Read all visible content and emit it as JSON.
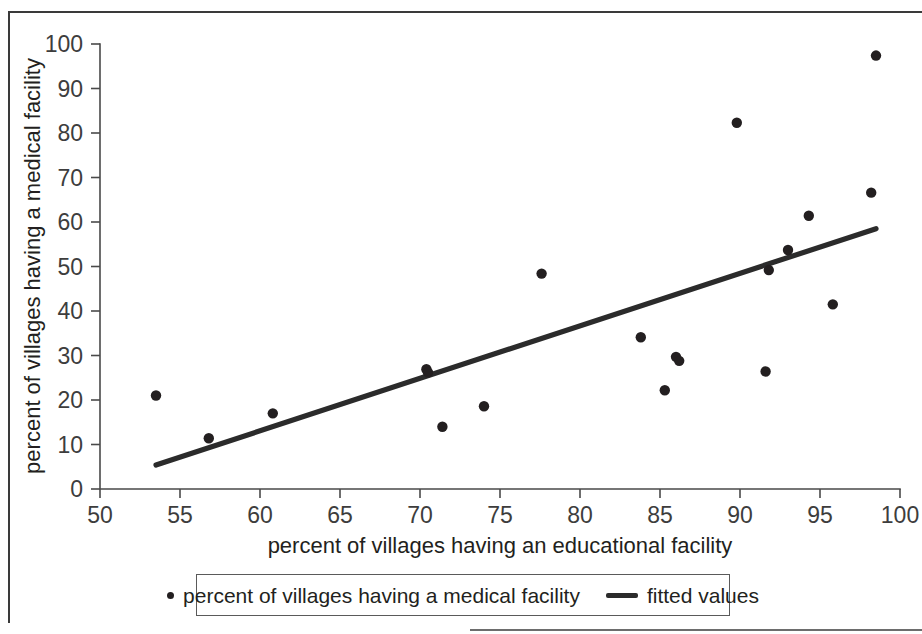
{
  "chart_data": {
    "type": "scatter",
    "title": "",
    "xlabel": "percent of villages having an educational facility",
    "ylabel": "percent of villages having a medical facility",
    "xlim": [
      50,
      100
    ],
    "ylim": [
      0,
      100
    ],
    "grid": false,
    "xticks": [
      "50",
      "55",
      "60",
      "65",
      "70",
      "75",
      "80",
      "85",
      "90",
      "95",
      "100"
    ],
    "xtick_values": [
      50,
      55,
      60,
      65,
      70,
      75,
      80,
      85,
      90,
      95,
      100
    ],
    "yticks": [
      "0",
      "10",
      "20",
      "30",
      "40",
      "50",
      "60",
      "70",
      "80",
      "90",
      "100"
    ],
    "ytick_values": [
      0,
      10,
      20,
      30,
      40,
      50,
      60,
      70,
      80,
      90,
      100
    ],
    "legend_position": "below-axes",
    "marker_color": "#231f20",
    "line_color": "#2b2b2b",
    "series": [
      {
        "name": "percent of villages having a medical facility",
        "type": "scatter",
        "points": [
          [
            53.5,
            21.0
          ],
          [
            56.8,
            11.4
          ],
          [
            60.8,
            17.0
          ],
          [
            70.4,
            26.9
          ],
          [
            70.5,
            26.2
          ],
          [
            71.4,
            14.0
          ],
          [
            74.0,
            18.6
          ],
          [
            77.6,
            48.4
          ],
          [
            83.8,
            34.1
          ],
          [
            85.3,
            22.2
          ],
          [
            86.0,
            29.7
          ],
          [
            86.2,
            28.8
          ],
          [
            89.8,
            82.3
          ],
          [
            91.6,
            26.4
          ],
          [
            91.8,
            49.2
          ],
          [
            93.0,
            53.7
          ],
          [
            94.3,
            61.4
          ],
          [
            95.8,
            41.5
          ],
          [
            98.2,
            66.6
          ],
          [
            98.5,
            97.4
          ]
        ]
      },
      {
        "name": "fitted values",
        "type": "line",
        "points": [
          [
            53.5,
            5.4
          ],
          [
            98.5,
            58.5
          ]
        ]
      }
    ]
  },
  "legend": {
    "entries": [
      {
        "label": "percent of villages having a medical facility",
        "marker": "dot"
      },
      {
        "label": "fitted values",
        "marker": "line"
      }
    ]
  }
}
